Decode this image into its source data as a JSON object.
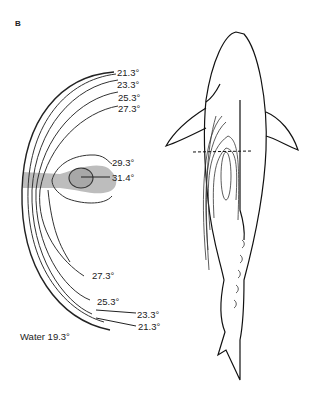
{
  "figure": {
    "panel_label": "B",
    "section_isotherms": {
      "upper_labels": [
        "21.3°",
        "23.3°",
        "25.3°",
        "27.3°"
      ],
      "core_labels": [
        "29.3°",
        "31.4°"
      ],
      "lower_labels": [
        "27.3°",
        "25.3°",
        "23.3°",
        "21.3°"
      ],
      "water_label": "Water 19.3°"
    },
    "colors": {
      "line": "#222222",
      "shading": "#bdbdbd",
      "background": "#ffffff"
    },
    "shark_view": {
      "description": "dorsal outline with internal isotherms and dashed section line"
    }
  }
}
